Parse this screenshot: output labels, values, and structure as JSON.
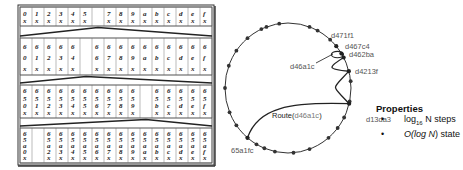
{
  "table": {
    "rows": [
      {
        "prefix_depth": 0,
        "empty_col": 6,
        "cells": [
          "0",
          "1",
          "2",
          "3",
          "4",
          "5",
          "",
          "7",
          "8",
          "9",
          "a",
          "b",
          "c",
          "d",
          "e",
          "f"
        ]
      },
      {
        "prefix_depth": 1,
        "prefix": "6",
        "empty_col": 5,
        "cells": [
          "0",
          "1",
          "2",
          "3",
          "4",
          "",
          "6",
          "7",
          "8",
          "9",
          "a",
          "b",
          "c",
          "d",
          "e",
          "f"
        ]
      },
      {
        "prefix_depth": 2,
        "prefix": "65",
        "empty_col": 10,
        "cells": [
          "0",
          "1",
          "2",
          "3",
          "4",
          "5",
          "6",
          "7",
          "8",
          "9",
          "",
          "b",
          "c",
          "d",
          "e",
          "f"
        ]
      },
      {
        "prefix_depth": 3,
        "prefix": "65a",
        "empty_col": 1,
        "cells": [
          "0",
          "",
          "2",
          "3",
          "4",
          "5",
          "6",
          "7",
          "8",
          "9",
          "a",
          "b",
          "c",
          "d",
          "e",
          "f"
        ]
      }
    ],
    "wildcard": "x"
  },
  "ring": {
    "nodes": {
      "d471f1": "d471f1",
      "d467c4": "d467c4",
      "d462ba": "d462ba",
      "d46a1c": "d46a1c",
      "d4213f": "d4213f",
      "d13da3": "d13da3",
      "65a1fc": "65a1fc"
    },
    "route_label_prefix": "Route(",
    "route_label_target": "d46a1c",
    "route_label_suffix": ")"
  },
  "properties": {
    "title": "Properties",
    "items": [
      {
        "bullet": "•",
        "pre": "log",
        "sub": "16",
        "post": " N steps"
      },
      {
        "bullet": "•",
        "pre": "O(",
        "italic": "log N",
        "post": ") state"
      }
    ]
  }
}
